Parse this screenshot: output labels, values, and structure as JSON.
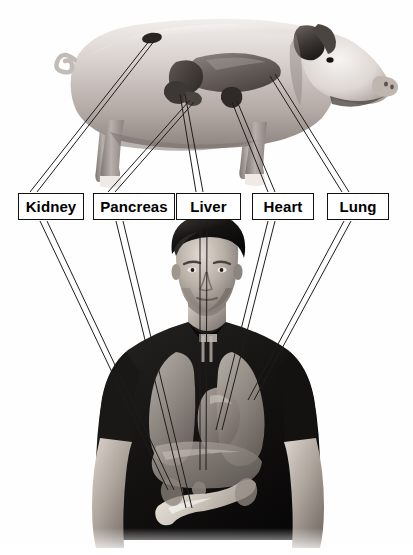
{
  "diagram": {
    "background_color": "#ffffff",
    "label_box": {
      "border_color": "#111111",
      "fill_color": "#ffffff",
      "text_color": "#000000"
    },
    "leader_line_color": "#1a1a1a",
    "source_figure": {
      "name": "pig",
      "description": "Grayscale photograph of a domestic pig in side profile facing right, with internal organs overlaid on the torso"
    },
    "target_figure": {
      "name": "human",
      "description": "Grayscale photograph of a young man in a dark short-sleeve t-shirt, with translucent internal organs overlaid on his chest and abdomen"
    },
    "labels": [
      {
        "id": "kidney",
        "text": "Kidney",
        "x": 18,
        "y": 193,
        "w": 66,
        "h": 27,
        "font_size": 15
      },
      {
        "id": "pancreas",
        "text": "Pancreas",
        "x": 93,
        "y": 193,
        "w": 82,
        "h": 27,
        "font_size": 15
      },
      {
        "id": "liver",
        "text": "Liver",
        "x": 176,
        "y": 193,
        "w": 65,
        "h": 27,
        "font_size": 15
      },
      {
        "id": "heart",
        "text": "Heart",
        "x": 252,
        "y": 193,
        "w": 62,
        "h": 27,
        "font_size": 15
      },
      {
        "id": "lung",
        "text": "Lung",
        "x": 327,
        "y": 193,
        "w": 62,
        "h": 27,
        "font_size": 15
      }
    ],
    "organ_count": 5
  }
}
